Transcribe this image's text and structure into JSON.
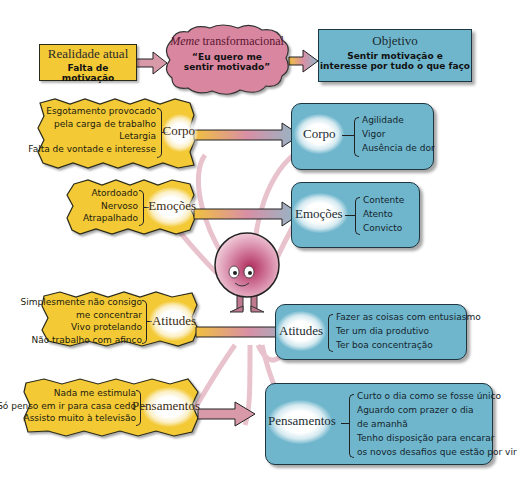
{
  "header": {
    "current": {
      "title": "Realidade atual",
      "subtitle": "Falta de motivação"
    },
    "meme": {
      "title_italic": "Meme",
      "title_rest": " transformacional",
      "quote_line1": "“Eu quero me",
      "quote_line2": "sentir motivado”"
    },
    "goal": {
      "title": "Objetivo",
      "line1": "Sentir motivação e",
      "line2": "interesse por tudo o que faço"
    }
  },
  "left": [
    {
      "label": "Corpo",
      "items": [
        "Esgotamento provocado",
        "pela carga de trabalho",
        "Letargia",
        "Falta de vontade e interesse"
      ]
    },
    {
      "label": "Emoções",
      "items": [
        "Atordoado",
        "Nervoso",
        "Atrapalhado"
      ]
    },
    {
      "label": "Atitudes",
      "items": [
        "Simplesmente não consigo",
        "me concentrar",
        "Vivo protelando",
        "Não trabalho com afinco"
      ]
    },
    {
      "label": "Pensamentos",
      "items": [
        "Nada me estimula",
        "Só penso em ir para casa cedo",
        "Assisto muito à televisão"
      ]
    }
  ],
  "right": [
    {
      "label": "Corpo",
      "items": [
        "Agilidade",
        "Vigor",
        "Ausência de dor"
      ]
    },
    {
      "label": "Emoções",
      "items": [
        "Contente",
        "Atento",
        "Convicto"
      ]
    },
    {
      "label": "Atitudes",
      "items": [
        "Fazer as coisas com entusiasmo",
        "Ter um dia produtivo",
        "Ter boa concentração"
      ]
    },
    {
      "label": "Pensamentos",
      "items": [
        "Curto o dia como se fosse único",
        "Aguardo com prazer o dia",
        "de amanhã",
        "Tenho disposição para encarar",
        "os novos desafios que estão por vir"
      ]
    }
  ],
  "colors": {
    "yellow": "#f3c936",
    "blue": "#6fb6cd",
    "pink": "#c8708a",
    "connector": "#e2b3c0"
  }
}
